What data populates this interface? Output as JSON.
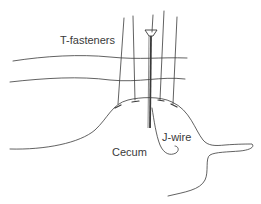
{
  "diagram": {
    "labels": {
      "t_fasteners": "T-fasteners",
      "cecum": "Cecum",
      "j_wire": "J-wire"
    },
    "colors": {
      "stroke": "#3a3a3a",
      "background": "#ffffff"
    }
  }
}
